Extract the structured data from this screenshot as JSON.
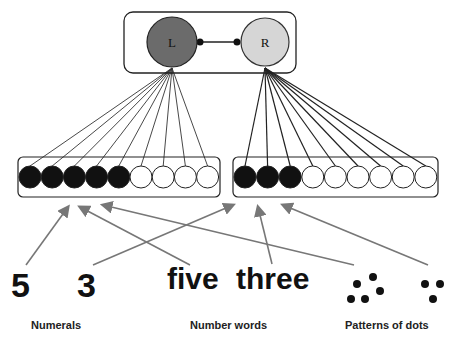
{
  "top_module": {
    "left_node": "L",
    "right_node": "R",
    "left_color": "#6b6b6b",
    "right_color": "#d6d6d6"
  },
  "left_bank": {
    "units": 9,
    "active": 5
  },
  "right_bank": {
    "units": 9,
    "active": 3
  },
  "stimuli": {
    "numeral_five": "5",
    "numeral_three": "3",
    "word_five": "five",
    "word_three": "three",
    "dots_five": 5,
    "dots_three": 3
  },
  "labels": {
    "numerals": "Numerals",
    "number_words": "Number words",
    "patterns": "Patterns of dots"
  },
  "arrow_color": "#777777"
}
